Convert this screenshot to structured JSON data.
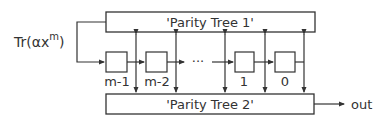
{
  "diagram": {
    "input_label": "Tr(αx",
    "input_exponent": "m",
    "input_close": ")",
    "parity_tree_1": "'Parity Tree 1'",
    "parity_tree_2": "'Parity Tree 2'",
    "registers": [
      {
        "label": "m-1"
      },
      {
        "label": "m-2"
      },
      {
        "label": "1"
      },
      {
        "label": "0"
      }
    ],
    "ellipsis": "···",
    "output_label": "out",
    "line_color": "#333333"
  }
}
